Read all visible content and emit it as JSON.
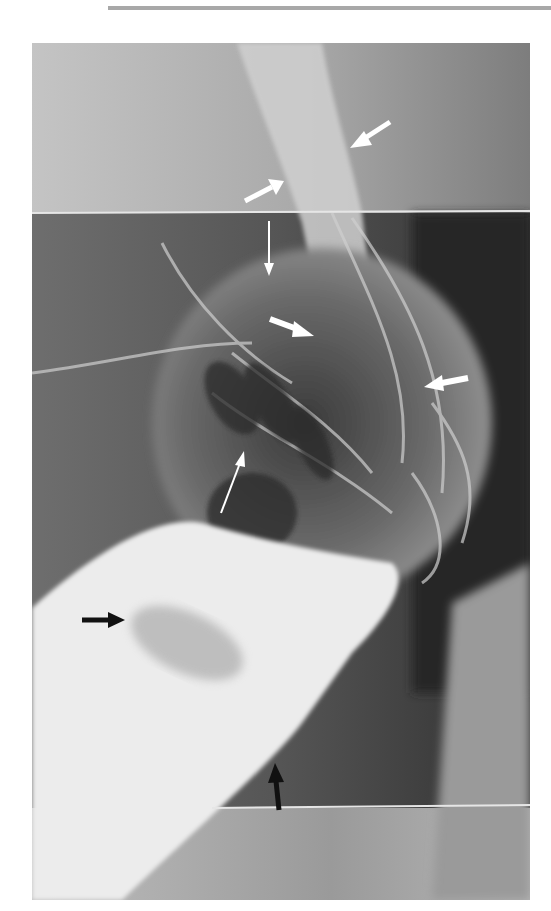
{
  "page": {
    "type": "radiograph-figure"
  },
  "figure": {
    "modality": "x-ray (barium study)",
    "annotations": [
      {
        "id": "white-arrow-1",
        "color": "white",
        "style": "thick",
        "direction": "down-left"
      },
      {
        "id": "white-arrow-2",
        "color": "white",
        "style": "thick",
        "direction": "up-right"
      },
      {
        "id": "white-arrow-3",
        "color": "white",
        "style": "thin",
        "direction": "down"
      },
      {
        "id": "white-arrow-4",
        "color": "white",
        "style": "thick",
        "direction": "down-right"
      },
      {
        "id": "white-arrow-5",
        "color": "white",
        "style": "thick",
        "direction": "left"
      },
      {
        "id": "white-arrow-6",
        "color": "white",
        "style": "thin",
        "direction": "up-right"
      },
      {
        "id": "black-arrow-1",
        "color": "black",
        "style": "thick",
        "direction": "right"
      },
      {
        "id": "black-arrow-2",
        "color": "black",
        "style": "thick",
        "direction": "up"
      }
    ],
    "colors": {
      "background": "#ffffff",
      "top_rule": "#a8a8a8",
      "arrow_white": "#ffffff",
      "arrow_black": "#111111"
    }
  }
}
